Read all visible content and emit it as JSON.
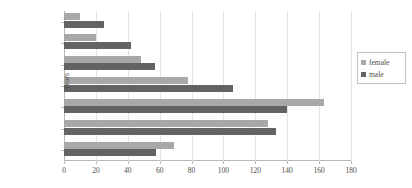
{
  "chart_data": {
    "type": "bar",
    "orientation": "horizontal",
    "title": "",
    "xlabel": "",
    "ylabel": "years",
    "categories": [
      "0 - 14",
      "15 - 24",
      "25 - 34",
      "35 - 44",
      "45 - 54",
      "55 - 64",
      "65+"
    ],
    "series": [
      {
        "name": "female",
        "color": "#a8a8a8",
        "values": [
          69,
          128,
          163,
          78,
          48,
          20,
          10
        ]
      },
      {
        "name": "male",
        "color": "#636363",
        "values": [
          58,
          133,
          140,
          106,
          57,
          42,
          25
        ]
      }
    ],
    "xlim": [
      0,
      180
    ],
    "xticks": [
      0,
      20,
      40,
      60,
      80,
      100,
      120,
      140,
      160,
      180
    ],
    "xtick_labels": [
      "0",
      "20",
      "40",
      "60",
      "80",
      "100",
      "120",
      "140",
      "160",
      "180"
    ],
    "grid": true,
    "grid_axis": "x",
    "legend_position": "right"
  },
  "legend": {
    "entries": [
      {
        "label": "female"
      },
      {
        "label": "male"
      }
    ]
  }
}
